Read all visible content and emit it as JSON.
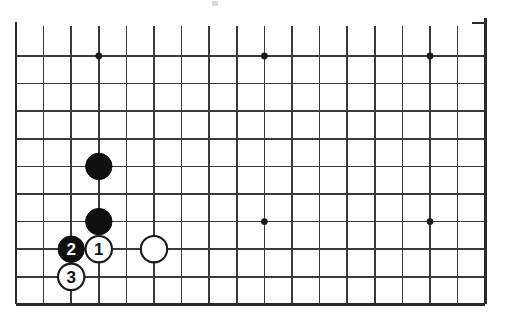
{
  "figure": {
    "kind": "go-board-diagram",
    "title": "",
    "caption": ""
  },
  "board": {
    "columns": 18,
    "rows": 10,
    "cell_size": 27.6,
    "origin_x": 16,
    "origin_y": 56,
    "line_color": "#3a3a3a",
    "border_color": "#2b2b2b",
    "background_color": "#ffffff",
    "partial_view": "bottom-left region of a full board, top and right edges cropped"
  },
  "star_points": [
    {
      "name": "star-point-top-left",
      "col": 3,
      "row": 0
    },
    {
      "name": "star-point-top-middle",
      "col": 9,
      "row": 0
    },
    {
      "name": "star-point-top-right",
      "col": 15,
      "row": 0
    },
    {
      "name": "star-point-mid-middle",
      "col": 9,
      "row": 6
    },
    {
      "name": "star-point-mid-right",
      "col": 15,
      "row": 6
    }
  ],
  "stones": [
    {
      "name": "black-stone-upper",
      "color": "black",
      "label": "",
      "col": 3,
      "row": 4
    },
    {
      "name": "black-stone-lower",
      "color": "black",
      "label": "",
      "col": 3,
      "row": 6
    },
    {
      "name": "black-stone-move-2",
      "color": "black",
      "label": "2",
      "col": 2,
      "row": 7
    },
    {
      "name": "white-stone-move-1",
      "color": "white",
      "label": "1",
      "col": 3,
      "row": 7
    },
    {
      "name": "white-stone-move-3",
      "color": "white",
      "label": "3",
      "col": 2,
      "row": 8
    },
    {
      "name": "white-stone-plain",
      "color": "white",
      "label": "",
      "col": 5,
      "row": 7
    }
  ],
  "move_sequence": [
    {
      "number": "1",
      "color": "white"
    },
    {
      "number": "2",
      "color": "black"
    },
    {
      "number": "3",
      "color": "white"
    }
  ],
  "edge_tick": {
    "name": "top-right-edge-tick",
    "present": true
  },
  "scan_artifact": {
    "name": "scan-speck",
    "present": true
  }
}
